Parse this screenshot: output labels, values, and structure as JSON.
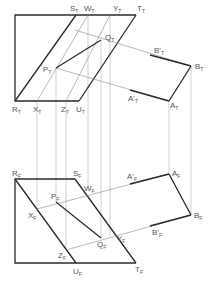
{
  "figure": {
    "type": "orthographic-projection",
    "views": {
      "top": {
        "suffix": "T",
        "labels": {
          "S": "S",
          "W": "W",
          "Y": "Y",
          "T": "T",
          "Q": "Q",
          "P": "P",
          "B_prime": "B'",
          "B": "B",
          "R": "R",
          "X": "X",
          "Z": "Z",
          "U": "U",
          "A_prime": "A'",
          "A": "A"
        }
      },
      "front": {
        "suffix": "F",
        "labels": {
          "R": "R",
          "S": "S",
          "P": "P",
          "W": "W",
          "A_prime": "A'",
          "A": "A",
          "X": "X",
          "Q": "Q",
          "Y": "Y",
          "B_prime": "B'",
          "B": "B",
          "Z": "Z",
          "U": "U",
          "T": "T"
        }
      }
    },
    "colors": {
      "outline": "#2a2a2a",
      "construction": "#8a8a8a",
      "projection": "#b4b4b4",
      "label": "#555555"
    }
  }
}
